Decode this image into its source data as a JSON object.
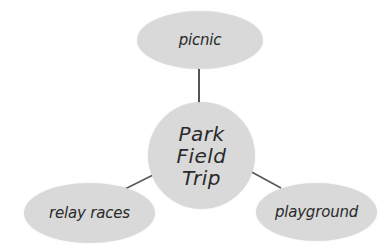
{
  "diagram": {
    "type": "mind-map",
    "center": {
      "label": "Park\nField\nTrip"
    },
    "nodes": [
      {
        "id": "picnic",
        "label": "picnic"
      },
      {
        "id": "relay-races",
        "label": "relay races"
      },
      {
        "id": "playground",
        "label": "playground"
      }
    ],
    "edges": [
      {
        "from": "center",
        "to": "picnic"
      },
      {
        "from": "center",
        "to": "relay-races"
      },
      {
        "from": "center",
        "to": "playground"
      }
    ],
    "colors": {
      "node_fill": "#d9d9d9",
      "line": "#555555",
      "text": "#2a2a2a",
      "background": "#ffffff"
    }
  }
}
